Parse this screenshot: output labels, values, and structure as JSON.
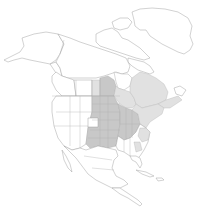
{
  "map": {
    "type": "species-range-map",
    "region": "North America",
    "colors": {
      "background": "#ffffff",
      "land": "#ffffff",
      "outline": "#9a9a9a",
      "range_core": "#c8c8c8",
      "range_peripheral": "#e1e1e1"
    },
    "regions": [
      {
        "name": "alaska",
        "shaded": "none"
      },
      {
        "name": "canadian-arctic-archipelago",
        "shaded": "none"
      },
      {
        "name": "greenland",
        "shaded": "none"
      },
      {
        "name": "yukon-nwt-nunavut",
        "shaded": "none"
      },
      {
        "name": "british-columbia",
        "shaded": "none"
      },
      {
        "name": "alberta",
        "shaded": "none"
      },
      {
        "name": "saskatchewan",
        "shaded": "light"
      },
      {
        "name": "manitoba",
        "shaded": "core"
      },
      {
        "name": "ontario",
        "shaded": "light"
      },
      {
        "name": "quebec",
        "shaded": "light"
      },
      {
        "name": "atlantic-canada",
        "shaded": "light"
      },
      {
        "name": "western-us",
        "shaded": "none"
      },
      {
        "name": "central-us-plains",
        "shaded": "core"
      },
      {
        "name": "midwest-us",
        "shaded": "core"
      },
      {
        "name": "southeast-us",
        "shaded": "partial"
      },
      {
        "name": "northeast-us",
        "shaded": "light"
      },
      {
        "name": "mexico",
        "shaded": "none"
      },
      {
        "name": "central-america",
        "shaded": "none"
      },
      {
        "name": "caribbean",
        "shaded": "none"
      }
    ]
  }
}
